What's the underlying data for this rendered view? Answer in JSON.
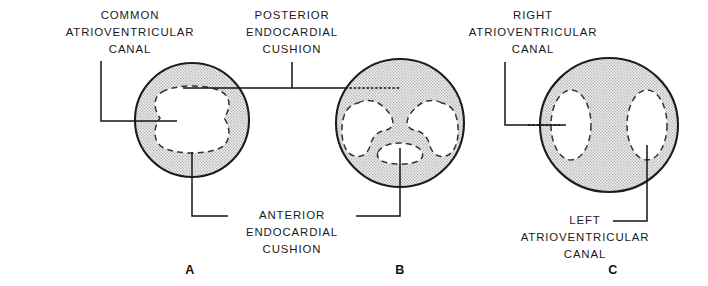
{
  "figure": {
    "background_color": "#ffffff",
    "ink_color": "#1a1a1a",
    "stipple_fill_color": "#c9c9c9",
    "lumen_fill_color": "#ffffff"
  },
  "labels": {
    "common_av_canal": {
      "lines": [
        "COMMON",
        "ATRIOVENTRICULAR",
        "CANAL"
      ],
      "line1": "COMMON",
      "line2": "ATRIOVENTRICULAR",
      "line3": "CANAL"
    },
    "posterior_endocardial_cushion": {
      "lines": [
        "POSTERIOR",
        "ENDOCARDIAL",
        "CUSHION"
      ],
      "line1": "POSTERIOR",
      "line2": "ENDOCARDIAL",
      "line3": "CUSHION"
    },
    "right_av_canal": {
      "lines": [
        "RIGHT",
        "ATRIOVENTRICULAR",
        "CANAL"
      ],
      "line1": "RIGHT",
      "line2": "ATRIOVENTRICULAR",
      "line3": "CANAL"
    },
    "anterior_endocardial_cushion": {
      "lines": [
        "ANTERIOR",
        "ENDOCARDIAL",
        "CUSHION"
      ],
      "line1": "ANTERIOR",
      "line2": "ENDOCARDIAL",
      "line3": "CUSHION"
    },
    "left_av_canal": {
      "lines": [
        "LEFT",
        "ATRIOVENTRICULAR",
        "CANAL"
      ],
      "line1": "LEFT",
      "line2": "ATRIOVENTRICULAR",
      "line3": "CANAL"
    }
  },
  "panels": [
    {
      "letter": "A",
      "stage_description": "Common atrioventricular canal with anterior and posterior endocardial cushions bulging inward",
      "outline_shape": "circle",
      "lumen_shape": "hourglass"
    },
    {
      "letter": "B",
      "stage_description": "Endocardial cushions approaching and partially fusing, narrowing the canal",
      "outline_shape": "circle",
      "lumen_shape": "trilobed"
    },
    {
      "letter": "C",
      "stage_description": "Cushions fused, forming separate right and left atrioventricular canals",
      "outline_shape": "ellipse",
      "lumen_shape": "two-ovals"
    }
  ]
}
